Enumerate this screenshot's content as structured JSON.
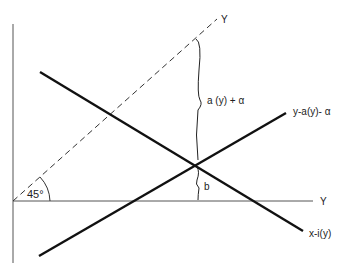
{
  "diagram": {
    "colors": {
      "line": "#111111",
      "axis": "#555555",
      "background": "#ffffff"
    },
    "labels": {
      "dashed_line_end": "Y",
      "upper_brace": "a  (y) + α",
      "rising_line": "y-a(y)- α",
      "lower_brace": "b",
      "horizontal_axis": "Y",
      "falling_line": "x-i(y)",
      "angle": "45°"
    },
    "elements": [
      {
        "id": "vertical-axis",
        "type": "axis"
      },
      {
        "id": "horizontal-axis",
        "type": "axis"
      },
      {
        "id": "45-degree-line",
        "type": "dashed-line"
      },
      {
        "id": "falling-line",
        "type": "line"
      },
      {
        "id": "rising-line",
        "type": "line"
      },
      {
        "id": "upper-brace",
        "type": "brace"
      },
      {
        "id": "lower-brace",
        "type": "brace"
      },
      {
        "id": "angle-arc",
        "type": "arc"
      }
    ]
  }
}
